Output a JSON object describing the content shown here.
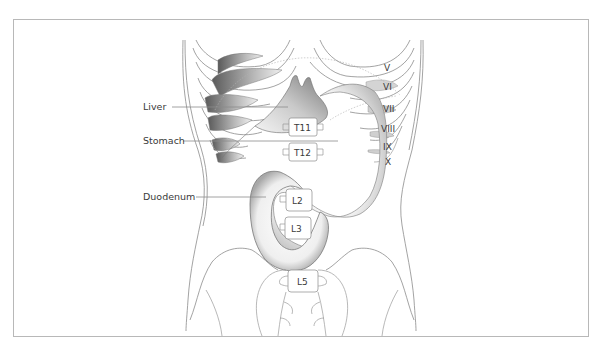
{
  "figure": {
    "type": "anatomical-illustration",
    "labels_left": [
      {
        "id": "liver",
        "text": "Liver"
      },
      {
        "id": "stomach",
        "text": "Stomach"
      },
      {
        "id": "duodenum",
        "text": "Duodenum"
      }
    ],
    "rib_labels": [
      "V",
      "VI",
      "VII",
      "VIII",
      "IX",
      "X"
    ],
    "vertebra_labels": [
      "T11",
      "T12",
      "L2",
      "L3",
      "L5"
    ],
    "colors": {
      "frame_border": "#b8b8b8",
      "outline": "#8c8c8c",
      "text": "#3a3a3a",
      "organ_shade_dark": "#6e6e6e",
      "organ_shade_light": "#f2f2f2"
    }
  }
}
